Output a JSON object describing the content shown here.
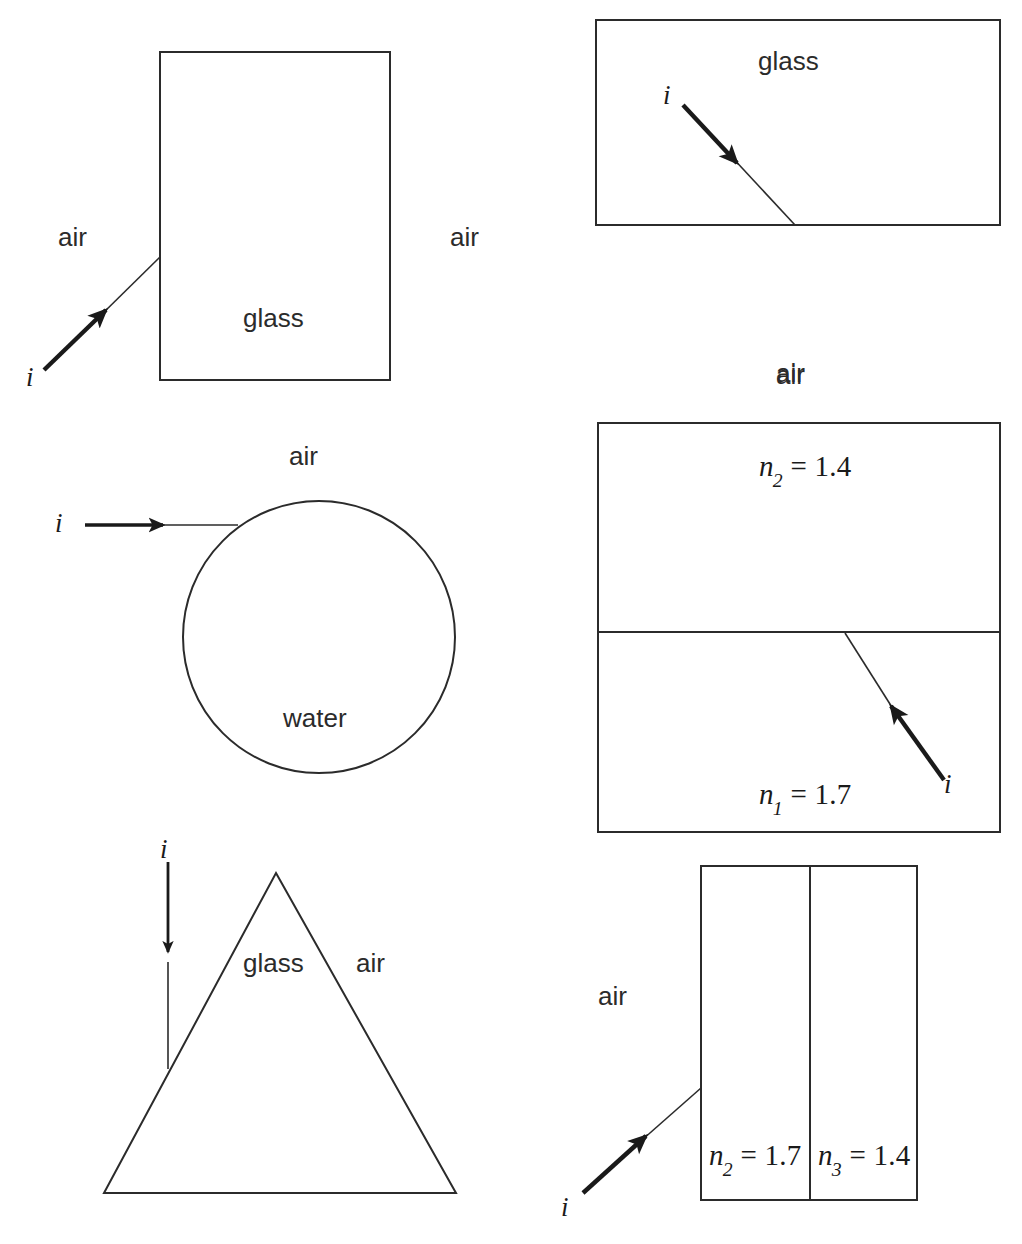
{
  "figure": {
    "kind": "optics-refraction-diagram",
    "panel_count": 6,
    "stroke_color": "#2b2b2b",
    "background_color": "#ffffff"
  },
  "panels": [
    {
      "id": "panel-a",
      "shape": "rectangle",
      "labels": {
        "left_medium": "air",
        "right_medium": "air",
        "inside_medium": "glass",
        "ray": "i"
      },
      "ray": {
        "direction": "up-right",
        "hits": "left-face",
        "incident_from": "air"
      }
    },
    {
      "id": "panel-b",
      "shape": "rectangle-wide",
      "labels": {
        "inside_medium": "glass",
        "below_medium": "air",
        "ray": "i"
      },
      "ray": {
        "direction": "down-right",
        "hits": "bottom-face",
        "incident_from": "glass"
      }
    },
    {
      "id": "panel-c",
      "shape": "circle",
      "labels": {
        "outside_medium": "air",
        "inside_medium": "water",
        "ray": "i"
      },
      "ray": {
        "direction": "right",
        "hits": "upper-left-arc",
        "incident_from": "air"
      }
    },
    {
      "id": "panel-d",
      "shape": "two-stacked-rectangles",
      "labels": {
        "above_medium": "air",
        "top_index_symbol": "n",
        "top_index_subscript": "2",
        "top_index_value": "= 1.4",
        "bottom_index_symbol": "n",
        "bottom_index_subscript": "1",
        "bottom_index_value": "= 1.7",
        "ray": "i"
      },
      "ray": {
        "direction": "up-left",
        "hits": "internal-interface",
        "incident_from": "n1 = 1.7"
      }
    },
    {
      "id": "panel-e",
      "shape": "triangle",
      "labels": {
        "inside_medium": "glass",
        "outside_medium": "air",
        "ray": "i"
      },
      "ray": {
        "direction": "down",
        "hits": "left-face",
        "incident_from": "air"
      }
    },
    {
      "id": "panel-f",
      "shape": "two-side-by-side-rectangles",
      "labels": {
        "left_medium": "air",
        "left_index_symbol": "n",
        "left_index_subscript": "2",
        "left_index_value": "= 1.7",
        "right_index_symbol": "n",
        "right_index_subscript": "3",
        "right_index_value": "= 1.4",
        "ray": "i"
      },
      "ray": {
        "direction": "up-right",
        "hits": "left-face",
        "incident_from": "air"
      }
    }
  ],
  "text_items": {
    "a_air_left": "air",
    "a_air_right": "air",
    "a_glass": "glass",
    "a_i": "i",
    "b_glass": "glass",
    "b_air": "air",
    "b_i": "i",
    "c_air": "air",
    "c_water": "water",
    "c_i": "i",
    "d_air": "air",
    "d_n": "n",
    "d_n2_sub": "2",
    "d_n2_val": "= 1.4",
    "d_n1_sub": "1",
    "d_n1_val": "= 1.7",
    "d_i": "i",
    "e_glass": "glass",
    "e_air": "air",
    "e_i": "i",
    "f_air": "air",
    "f_n": "n",
    "f_n2_sub": "2",
    "f_n2_val": "= 1.7",
    "f_n3_sub": "3",
    "f_n3_val": "= 1.4",
    "f_i": "i"
  }
}
